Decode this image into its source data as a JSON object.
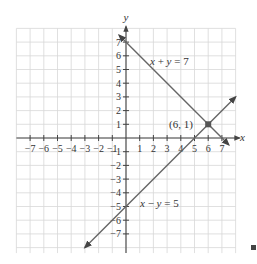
{
  "chart_data": {
    "type": "line",
    "title": "",
    "xlabel": "x",
    "ylabel": "y",
    "xlim": [
      -8,
      8
    ],
    "ylim": [
      -8.5,
      8
    ],
    "grid": true,
    "x_ticks": [
      -7,
      -6,
      -5,
      -4,
      -3,
      -2,
      -1,
      1,
      2,
      3,
      4,
      5,
      6,
      7
    ],
    "y_ticks": [
      -7,
      -6,
      -5,
      -4,
      -3,
      -2,
      -1,
      1,
      2,
      3,
      4,
      5,
      6,
      7
    ],
    "series": [
      {
        "name": "x + y = 7",
        "equation": "x + y = 7",
        "color": "#666666",
        "x": [
          -0.5,
          7.5
        ],
        "y": [
          7.5,
          -0.5
        ]
      },
      {
        "name": "x - y = 5",
        "equation": "x − y = 5",
        "color": "#666666",
        "x": [
          -3,
          8
        ],
        "y": [
          -8,
          3
        ]
      }
    ],
    "annotations": [
      {
        "text": "(6, 1)",
        "x": 6,
        "y": 1,
        "type": "intersection-point"
      }
    ],
    "labels": {
      "line1": "x + y = 7",
      "line2": "x − y = 5",
      "point": "(6, 1)",
      "x_axis": "x",
      "y_axis": "y"
    }
  },
  "end_marker": "■"
}
